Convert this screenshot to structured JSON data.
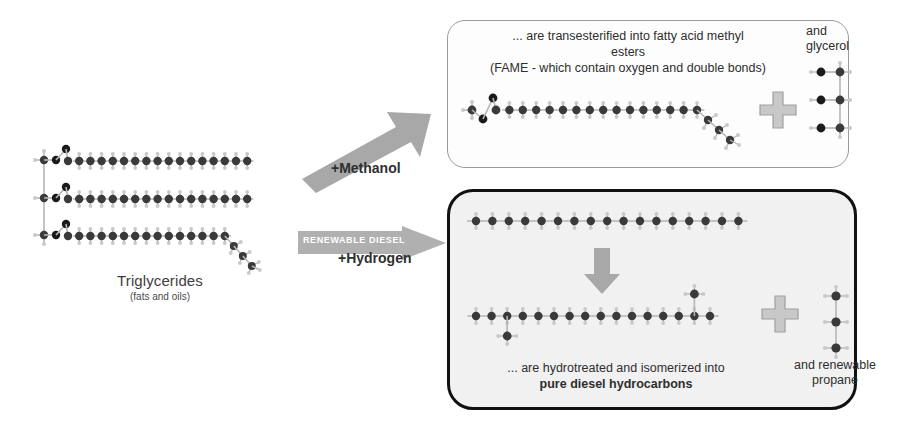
{
  "diagram": {
    "colors": {
      "carbon": "#3a3a3a",
      "oxygen": "#1a1a1a",
      "hydrogen": "#c9c9c9",
      "bond": "#b5b5b5",
      "arrow_gray": "#a8a8a8",
      "plus_gray": "#c2c2c2",
      "panel_top_border": "#9a9a9a",
      "panel_bottom_border": "#111111",
      "panel_bottom_fill": "#f1f1f1",
      "text": "#2e2e2e"
    }
  },
  "feedstock": {
    "label": "Triglycerides",
    "sublabel": "(fats and oils)",
    "molecule_name": "triglyceride-molecule",
    "chain_count": 3,
    "chain_lengths": [
      16,
      16,
      14
    ],
    "unsaturated_kink_chain": 3
  },
  "pathways": {
    "fame": {
      "arrow_name": "fame-arrow",
      "arrow_label": "FAME",
      "reagent_label": "+Methanol",
      "direction": "up-right"
    },
    "renewable_diesel": {
      "arrow_name": "renewable-diesel-arrow",
      "arrow_label": "RENEWABLE DIESEL",
      "reagent_label": "+Hydrogen",
      "direction": "right"
    }
  },
  "panel_top": {
    "name": "fame-product-panel",
    "text_line1": "... are transesterified into fatty acid methyl",
    "text_line2": "esters",
    "text_line3": "(FAME - which contain oxygen and double bonds)",
    "product_molecule": "fatty-acid-methyl-ester-molecule",
    "plus_sign": "+",
    "coproduct_line1": "and",
    "coproduct_line2": "glycerol",
    "coproduct_molecule": "glycerol-molecule"
  },
  "panel_bottom": {
    "name": "renewable-diesel-product-panel",
    "reactant_molecule": "straight-chain-alkane-molecule",
    "process_arrow": "isomerization-down-arrow",
    "product_molecule": "branched-diesel-hydrocarbon-molecule",
    "text_line1": "... are hydrotreated and isomerized into",
    "text_line2": "pure diesel hydrocarbons",
    "plus_sign": "+",
    "coproduct_line1": "and renewable",
    "coproduct_line2": "propane",
    "coproduct_molecule": "propane-molecule"
  }
}
